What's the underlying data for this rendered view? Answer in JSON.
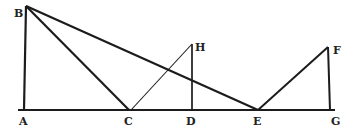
{
  "diagram": {
    "colors": {
      "line": "#1c1c1c",
      "label": "#222222",
      "background": "#ffffff"
    },
    "points": {
      "A": {
        "label": "A",
        "x": 24,
        "y": 110
      },
      "B": {
        "label": "B",
        "x": 26,
        "y": 6
      },
      "C": {
        "label": "C",
        "x": 129,
        "y": 110
      },
      "D": {
        "label": "D",
        "x": 192,
        "y": 110
      },
      "E": {
        "label": "E",
        "x": 258,
        "y": 110
      },
      "F": {
        "label": "F",
        "x": 328,
        "y": 47
      },
      "G": {
        "label": "G",
        "x": 330,
        "y": 110
      },
      "H": {
        "label": "H",
        "x": 192,
        "y": 44
      }
    },
    "segments": [
      {
        "from": "baseline-start",
        "to": "baseline-end",
        "name": "baseline"
      },
      {
        "from": "A",
        "to": "B"
      },
      {
        "from": "B",
        "to": "C"
      },
      {
        "from": "B",
        "to": "E"
      },
      {
        "from": "C",
        "to": "H"
      },
      {
        "from": "H",
        "to": "D"
      },
      {
        "from": "E",
        "to": "F"
      },
      {
        "from": "F",
        "to": "G"
      }
    ],
    "labels": {
      "A": "A",
      "B": "B",
      "C": "C",
      "D": "D",
      "E": "E",
      "F": "F",
      "G": "G",
      "H": "H"
    }
  }
}
